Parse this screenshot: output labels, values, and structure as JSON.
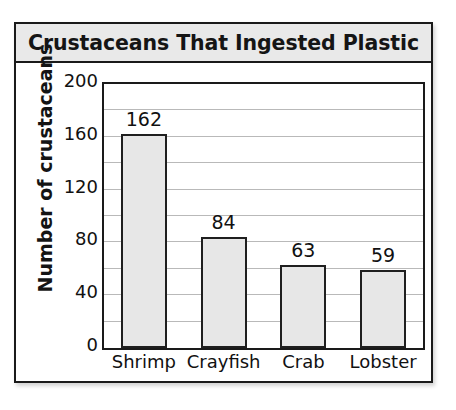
{
  "chart_data": {
    "type": "bar",
    "title": "Crustaceans That Ingested Plastic",
    "xlabel": "",
    "ylabel": "Number of crustaceans",
    "categories": [
      "Shrimp",
      "Crayfish",
      "Crab",
      "Lobster"
    ],
    "values": [
      162,
      84,
      63,
      59
    ],
    "value_labels": [
      "162",
      "84",
      "63",
      "59"
    ],
    "ylim": [
      0,
      200
    ],
    "y_ticks": [
      200,
      160,
      120,
      80,
      40,
      0
    ],
    "y_tick_labels": [
      "200",
      "160",
      "120",
      "80",
      "40",
      "0"
    ],
    "gridline_interval": 20,
    "grid": true,
    "legend": "none",
    "colors": {
      "bar_fill": "#e7e7e7",
      "bar_border": "#1f1f1f",
      "title_band": "#e9e9e9",
      "frame": "#1a1a1a",
      "gridline": "#b9b9b9",
      "text": "#111111"
    }
  }
}
